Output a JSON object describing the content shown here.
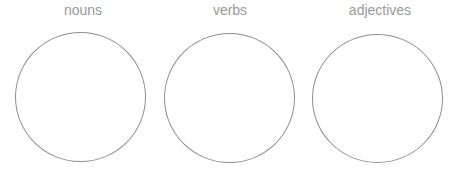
{
  "diagram": {
    "type": "sorting-circles",
    "stroke_color": "#8f8f8f",
    "label_color": "#9a9a9a",
    "groups": [
      {
        "label": "nouns"
      },
      {
        "label": "verbs"
      },
      {
        "label": "adjectives"
      }
    ]
  }
}
